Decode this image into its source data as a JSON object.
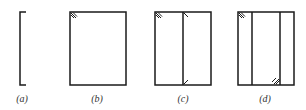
{
  "diagram": {
    "panels": [
      {
        "id": "a",
        "label": "(a)",
        "shape": "open bracket"
      },
      {
        "id": "b",
        "label": "(b)",
        "shape": "rectangle with hatch mark at top-left corner"
      },
      {
        "id": "c",
        "label": "(c)",
        "shape": "rectangle with one vertical divider; hatch marks at top-left corner and divider ends"
      },
      {
        "id": "d",
        "label": "(d)",
        "shape": "rectangle with two vertical dividers; hatch marks at top-left corner and bottom of second divider"
      }
    ],
    "colors": {
      "line": "#1a1a1a",
      "label": "#333333",
      "background": "#ffffff"
    }
  }
}
